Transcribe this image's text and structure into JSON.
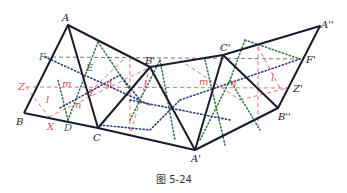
{
  "caption": "图 5-24",
  "colors": {
    "solid": "#1a1a2e",
    "dashed_black": "#333344",
    "dotted_blue": "#2c3e7a",
    "dotted_green": "#3a7a4a",
    "dashed_red": "#d9534f",
    "label_black": "#222222",
    "label_green": "#3a6b4a",
    "label_red": "#d9534f"
  },
  "points": {
    "A": "A",
    "B": "B",
    "C": "C",
    "D": "D",
    "E": "E",
    "F": "F",
    "X": "X",
    "Y": "Y",
    "Z": "Z",
    "A1": "A'",
    "B1": "B'",
    "C1": "C'",
    "A2": "A''",
    "B2": "B''",
    "F1": "F'",
    "Z1": "Z'"
  },
  "angle_labels": {
    "m1": "m",
    "n1": "n",
    "l1": "l",
    "n2": "n",
    "l2": "l",
    "m2": "m",
    "n3": "n",
    "l3": "l"
  }
}
